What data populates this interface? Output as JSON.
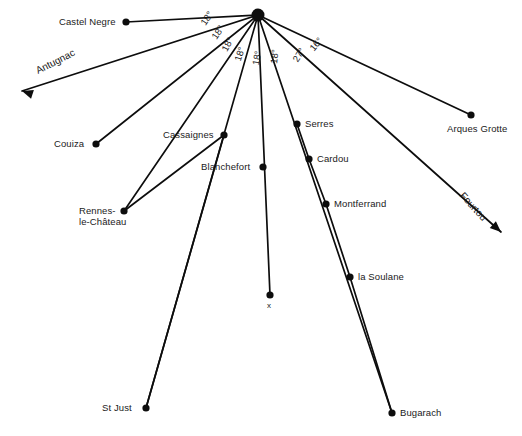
{
  "diagram": {
    "background_color": "#ffffff",
    "line_color": "#0d0d0d",
    "text_color": "#1a1a1a",
    "hub": {
      "name": "central-convergence-point",
      "x": 258,
      "y": 15,
      "radius": 6.5
    },
    "nodes": [
      {
        "id": "castel-negre",
        "label": "Castel Negre",
        "dot_x": 126,
        "dot_y": 22,
        "label_x": 59,
        "label_y": 16,
        "align": "left"
      },
      {
        "id": "couiza",
        "label": "Couiza",
        "dot_x": 96,
        "dot_y": 144,
        "label_x": 54,
        "label_y": 138,
        "align": "left"
      },
      {
        "id": "cassaignes",
        "label": "Cassaignes",
        "dot_x": 224,
        "dot_y": 135,
        "label_x": 163,
        "label_y": 129,
        "align": "left"
      },
      {
        "id": "serres",
        "label": "Serres",
        "dot_x": 297,
        "dot_y": 124,
        "label_x": 305,
        "label_y": 118,
        "align": "left"
      },
      {
        "id": "arques-grotte",
        "label": "Arques Grotte",
        "dot_x": 471,
        "dot_y": 115,
        "label_x": 447,
        "label_y": 123,
        "align": "left"
      },
      {
        "id": "cardou",
        "label": "Cardou",
        "dot_x": 309,
        "dot_y": 159,
        "label_x": 317,
        "label_y": 153,
        "align": "left"
      },
      {
        "id": "blanchefort",
        "label": "Blanchefort",
        "dot_x": 263,
        "dot_y": 167,
        "label_x": 201,
        "label_y": 161,
        "align": "left"
      },
      {
        "id": "montferrand",
        "label": "Montferrand",
        "dot_x": 326,
        "dot_y": 204,
        "label_x": 334,
        "label_y": 198,
        "align": "left"
      },
      {
        "id": "rennes-le-chateau",
        "label": "Rennes-\nle-Château",
        "dot_x": 124,
        "dot_y": 211,
        "label_x": 79,
        "label_y": 205,
        "align": "left"
      },
      {
        "id": "la-soulane",
        "label": "la Soulane",
        "dot_x": 350,
        "dot_y": 277,
        "label_x": 358,
        "label_y": 271,
        "align": "left"
      },
      {
        "id": "x-marker",
        "label": "x",
        "dot_x": 270,
        "dot_y": 295,
        "label_x": 267,
        "label_y": 301,
        "align": "left"
      },
      {
        "id": "st-just",
        "label": "St Just",
        "dot_x": 146,
        "dot_y": 408,
        "label_x": 102,
        "label_y": 402,
        "align": "left"
      },
      {
        "id": "bugarach",
        "label": "Bugarach",
        "dot_x": 392,
        "dot_y": 413,
        "label_x": 400,
        "label_y": 407,
        "align": "left"
      }
    ],
    "rays": [
      {
        "id": "ray-castel-negre",
        "target": "castel-negre",
        "x2": 126,
        "y2": 22
      },
      {
        "id": "ray-couiza",
        "target": "couiza",
        "x2": 96,
        "y2": 144
      },
      {
        "id": "ray-rennes-le-chateau",
        "target": "rennes-le-chateau",
        "x2": 124,
        "y2": 211
      },
      {
        "id": "ray-st-just",
        "target": "st-just",
        "x2": 146,
        "y2": 408
      },
      {
        "id": "ray-x-marker",
        "target": "x-marker",
        "x2": 270,
        "y2": 295
      },
      {
        "id": "ray-bugarach",
        "target": "bugarach",
        "x2": 392,
        "y2": 413
      },
      {
        "id": "ray-arques-grotte",
        "target": "arques-grotte",
        "x2": 471,
        "y2": 115
      }
    ],
    "chains": [
      {
        "id": "chain-cassaignes-rennes",
        "points": [
          [
            224,
            135
          ],
          [
            124,
            211
          ]
        ]
      },
      {
        "id": "chain-hub-serres-cardou-montferrand-soulane-bugarach",
        "points": [
          [
            297,
            124
          ],
          [
            309,
            159
          ],
          [
            326,
            204
          ],
          [
            350,
            277
          ],
          [
            392,
            413
          ]
        ]
      },
      {
        "id": "chain-hub-cassaignes-blanchefort-stjust",
        "points": [
          [
            224,
            135
          ],
          [
            146,
            408
          ]
        ]
      }
    ],
    "angles": [
      {
        "id": "angle-1",
        "value": "18°",
        "x": 198,
        "y": 21,
        "rotate": -56
      },
      {
        "id": "angle-2",
        "value": "18°",
        "x": 209,
        "y": 35,
        "rotate": -56
      },
      {
        "id": "angle-3",
        "value": "18°",
        "x": 219,
        "y": 48,
        "rotate": -62
      },
      {
        "id": "angle-4",
        "value": "18°",
        "x": 232,
        "y": 59,
        "rotate": -72
      },
      {
        "id": "angle-5",
        "value": "18°",
        "x": 250,
        "y": 64,
        "rotate": -80
      },
      {
        "id": "angle-6",
        "value": "18°",
        "x": 268,
        "y": 63,
        "rotate": -84
      },
      {
        "id": "angle-7",
        "value": "27°",
        "x": 290,
        "y": 58,
        "rotate": -58
      },
      {
        "id": "angle-8",
        "value": "16°",
        "x": 307,
        "y": 46,
        "rotate": -50
      }
    ],
    "routes": [
      {
        "id": "route-antugnac",
        "label": "Antugnac",
        "label_x": 34,
        "label_y": 66,
        "rotate": -27,
        "line": {
          "x1": 258,
          "y1": 15,
          "x2": 22,
          "y2": 91
        },
        "arrow": {
          "x": 22,
          "y": 91,
          "angle": 198
        }
      },
      {
        "id": "route-fourtou",
        "label": "Fourtou",
        "label_x": 466,
        "label_y": 190,
        "rotate": 48,
        "line": {
          "x1": 258,
          "y1": 15,
          "x2": 501,
          "y2": 232
        },
        "arrow": {
          "x": 501,
          "y": 232,
          "angle": 42
        }
      }
    ]
  }
}
